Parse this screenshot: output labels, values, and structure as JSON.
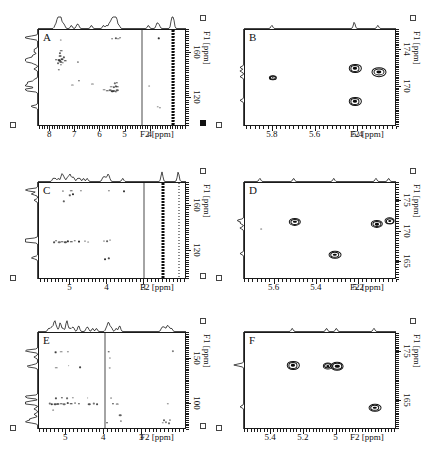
{
  "figure": {
    "type": "multi-panel-2d-nmr-spectra",
    "panel_count": 6,
    "background": "#ffffff",
    "ink": "#111111"
  },
  "axis_titles": {
    "x": "F2 [ppm]",
    "y": "F1 [ppm]"
  },
  "chart_data": [
    {
      "id": "A",
      "type": "scatter",
      "title": "A",
      "xlabel": "F2 [ppm]",
      "ylabel": "F1 [ppm]",
      "xlim": [
        8.45,
        2.55
      ],
      "ylim": [
        180,
        95
      ],
      "xticks": [
        8,
        7,
        6,
        5,
        4
      ],
      "yticks": [
        120,
        160
      ],
      "grid": false,
      "legend": "none",
      "annotations": [
        "solvent t1-noise ridge near 3.1 ppm",
        "vertical artifact line near 4.35 ppm"
      ],
      "ridges": [
        3.12,
        3.05
      ],
      "vlines": [
        4.35
      ],
      "points": [
        {
          "x": 7.62,
          "y": 153.0,
          "r": 2.4
        },
        {
          "x": 7.58,
          "y": 152.2,
          "r": 2.0
        },
        {
          "x": 7.66,
          "y": 153.6,
          "r": 1.8
        },
        {
          "x": 7.55,
          "y": 154.6,
          "r": 1.6
        },
        {
          "x": 7.5,
          "y": 151.4,
          "r": 1.5
        },
        {
          "x": 7.7,
          "y": 151.0,
          "r": 1.4
        },
        {
          "x": 7.46,
          "y": 156.0,
          "r": 1.4
        },
        {
          "x": 7.62,
          "y": 157.2,
          "r": 1.6
        },
        {
          "x": 7.58,
          "y": 149.6,
          "r": 1.5
        },
        {
          "x": 7.4,
          "y": 153.2,
          "r": 1.3
        },
        {
          "x": 7.76,
          "y": 154.0,
          "r": 1.3
        },
        {
          "x": 7.62,
          "y": 160.0,
          "r": 1.5
        },
        {
          "x": 7.56,
          "y": 162.0,
          "r": 1.3
        },
        {
          "x": 7.12,
          "y": 132.0,
          "r": 1.3
        },
        {
          "x": 6.84,
          "y": 135.6,
          "r": 1.2
        },
        {
          "x": 5.84,
          "y": 127.4,
          "r": 1.5
        },
        {
          "x": 5.72,
          "y": 126.6,
          "r": 1.4
        },
        {
          "x": 5.62,
          "y": 127.0,
          "r": 1.5
        },
        {
          "x": 5.52,
          "y": 126.2,
          "r": 1.6
        },
        {
          "x": 5.45,
          "y": 126.8,
          "r": 1.8
        },
        {
          "x": 5.38,
          "y": 126.0,
          "r": 1.7
        },
        {
          "x": 5.33,
          "y": 127.2,
          "r": 1.6
        },
        {
          "x": 5.58,
          "y": 130.4,
          "r": 1.4
        },
        {
          "x": 5.48,
          "y": 130.0,
          "r": 1.5
        },
        {
          "x": 5.4,
          "y": 130.8,
          "r": 1.5
        },
        {
          "x": 5.33,
          "y": 130.2,
          "r": 1.4
        },
        {
          "x": 5.44,
          "y": 133.2,
          "r": 1.3
        },
        {
          "x": 5.36,
          "y": 133.8,
          "r": 1.3
        },
        {
          "x": 6.32,
          "y": 133.0,
          "r": 1.2
        },
        {
          "x": 4.05,
          "y": 131.2,
          "r": 1.2
        },
        {
          "x": 3.72,
          "y": 112.4,
          "r": 1.5
        },
        {
          "x": 3.62,
          "y": 112.0,
          "r": 1.5
        },
        {
          "x": 5.3,
          "y": 172.4,
          "r": 1.5
        },
        {
          "x": 5.4,
          "y": 173.0,
          "r": 1.4
        },
        {
          "x": 5.22,
          "y": 173.2,
          "r": 1.3
        },
        {
          "x": 5.52,
          "y": 172.0,
          "r": 1.2
        },
        {
          "x": 3.68,
          "y": 172.8,
          "r": 1.3
        },
        {
          "x": 7.58,
          "y": 171.6,
          "r": 1.3
        },
        {
          "x": 7.66,
          "y": 145.0,
          "r": 1.2
        },
        {
          "x": 6.9,
          "y": 151.8,
          "r": 1.2
        }
      ]
    },
    {
      "id": "B",
      "type": "scatter",
      "title": "B",
      "xlabel": "F2 [ppm]",
      "ylabel": "F1 [ppm]",
      "xlim": [
        5.93,
        5.22
      ],
      "ylim": [
        176.2,
        165.6
      ],
      "xticks": [
        5.8,
        5.6,
        5.4
      ],
      "yticks": [
        170,
        174
      ],
      "grid": false,
      "legend": "none",
      "points": [
        {
          "x": 5.415,
          "y": 168.4,
          "r": 4.0,
          "style": "contour"
        },
        {
          "x": 5.415,
          "y": 172.0,
          "r": 4.0,
          "style": "contour"
        },
        {
          "x": 5.305,
          "y": 171.6,
          "r": 5.0,
          "style": "contour"
        },
        {
          "x": 5.8,
          "y": 171.0,
          "r": 2.4,
          "style": "contour"
        }
      ]
    },
    {
      "id": "C",
      "type": "scatter",
      "title": "C",
      "xlabel": "F2 [ppm]",
      "ylabel": "F1 [ppm]",
      "xlim": [
        5.85,
        1.85
      ],
      "ylim": [
        180,
        95
      ],
      "xticks": [
        5,
        4,
        3
      ],
      "yticks": [
        120,
        160
      ],
      "grid": false,
      "legend": "none",
      "annotations": [
        "intense solvent t1-noise ridge near 2.5 ppm",
        "second ridge near 2.05 ppm"
      ],
      "ridges": [
        2.5,
        2.06
      ],
      "vlines": [
        3.02
      ],
      "points": [
        {
          "x": 5.3,
          "y": 128.0,
          "r": 1.6
        },
        {
          "x": 5.22,
          "y": 128.6,
          "r": 1.7
        },
        {
          "x": 5.14,
          "y": 128.2,
          "r": 1.6
        },
        {
          "x": 5.06,
          "y": 129.0,
          "r": 1.5
        },
        {
          "x": 4.98,
          "y": 128.4,
          "r": 1.5
        },
        {
          "x": 5.38,
          "y": 129.2,
          "r": 1.4
        },
        {
          "x": 5.44,
          "y": 128.0,
          "r": 1.3
        },
        {
          "x": 4.88,
          "y": 129.4,
          "r": 1.3
        },
        {
          "x": 4.78,
          "y": 128.8,
          "r": 1.2
        },
        {
          "x": 4.62,
          "y": 129.2,
          "r": 1.2
        },
        {
          "x": 4.52,
          "y": 128.6,
          "r": 1.2
        },
        {
          "x": 4.1,
          "y": 129.4,
          "r": 1.4
        },
        {
          "x": 4.02,
          "y": 128.8,
          "r": 1.3
        },
        {
          "x": 3.92,
          "y": 130.0,
          "r": 1.3
        },
        {
          "x": 4.06,
          "y": 113.2,
          "r": 1.3
        },
        {
          "x": 3.96,
          "y": 114.0,
          "r": 1.2
        },
        {
          "x": 5.02,
          "y": 169.2,
          "r": 1.4
        },
        {
          "x": 4.92,
          "y": 170.0,
          "r": 1.3
        },
        {
          "x": 5.2,
          "y": 172.8,
          "r": 1.4
        },
        {
          "x": 4.98,
          "y": 173.4,
          "r": 1.4
        },
        {
          "x": 4.72,
          "y": 173.0,
          "r": 1.3
        },
        {
          "x": 3.96,
          "y": 173.2,
          "r": 1.4
        },
        {
          "x": 3.56,
          "y": 172.6,
          "r": 1.2
        },
        {
          "x": 5.18,
          "y": 164.0,
          "r": 1.2
        }
      ]
    },
    {
      "id": "D",
      "type": "scatter",
      "title": "D",
      "xlabel": "F2 [ppm]",
      "ylabel": "F1 [ppm]",
      "xlim": [
        5.74,
        5.02
      ],
      "ylim": [
        178.0,
        162.0
      ],
      "xticks": [
        5.6,
        5.4,
        5.2
      ],
      "yticks": [
        165,
        170,
        175
      ],
      "grid": false,
      "legend": "none",
      "points": [
        {
          "x": 5.315,
          "y": 166.2,
          "r": 4.2,
          "style": "contour"
        },
        {
          "x": 5.505,
          "y": 171.6,
          "r": 4.0,
          "style": "contour"
        },
        {
          "x": 5.115,
          "y": 171.2,
          "r": 4.0,
          "style": "contour"
        },
        {
          "x": 5.055,
          "y": 171.7,
          "r": 3.4,
          "style": "contour"
        },
        {
          "x": 5.665,
          "y": 170.4,
          "r": 1.2,
          "style": "weak"
        }
      ]
    },
    {
      "id": "E",
      "type": "scatter",
      "title": "E",
      "xlabel": "F2 [ppm]",
      "ylabel": "F1 [ppm]",
      "xlim": [
        5.72,
        1.82
      ],
      "ylim": [
        178,
        72
      ],
      "xticks": [
        5,
        4,
        3
      ],
      "yticks": [
        100,
        150
      ],
      "grid": false,
      "legend": "none",
      "vlines": [
        3.98
      ],
      "points": [
        {
          "x": 5.3,
          "y": 100.6,
          "r": 1.8
        },
        {
          "x": 5.22,
          "y": 100.0,
          "r": 1.9
        },
        {
          "x": 5.14,
          "y": 100.8,
          "r": 1.8
        },
        {
          "x": 5.06,
          "y": 100.2,
          "r": 1.7
        },
        {
          "x": 4.96,
          "y": 101.0,
          "r": 1.6
        },
        {
          "x": 4.88,
          "y": 100.4,
          "r": 1.5
        },
        {
          "x": 5.38,
          "y": 100.2,
          "r": 1.5
        },
        {
          "x": 5.44,
          "y": 101.0,
          "r": 1.4
        },
        {
          "x": 4.78,
          "y": 101.2,
          "r": 1.4
        },
        {
          "x": 4.66,
          "y": 100.6,
          "r": 1.3
        },
        {
          "x": 5.28,
          "y": 106.6,
          "r": 1.4
        },
        {
          "x": 5.12,
          "y": 107.2,
          "r": 1.4
        },
        {
          "x": 4.98,
          "y": 106.8,
          "r": 1.3
        },
        {
          "x": 4.82,
          "y": 107.4,
          "r": 1.3
        },
        {
          "x": 5.34,
          "y": 94.0,
          "r": 1.2
        },
        {
          "x": 4.4,
          "y": 100.4,
          "r": 1.4
        },
        {
          "x": 4.28,
          "y": 101.0,
          "r": 1.4
        },
        {
          "x": 4.18,
          "y": 100.2,
          "r": 1.3
        },
        {
          "x": 4.44,
          "y": 107.0,
          "r": 1.2
        },
        {
          "x": 3.78,
          "y": 100.8,
          "r": 1.5
        },
        {
          "x": 3.66,
          "y": 100.2,
          "r": 1.3
        },
        {
          "x": 3.82,
          "y": 107.2,
          "r": 1.3
        },
        {
          "x": 3.58,
          "y": 88.0,
          "r": 1.4
        },
        {
          "x": 3.56,
          "y": 81.6,
          "r": 1.4
        },
        {
          "x": 3.92,
          "y": 80.0,
          "r": 1.3
        },
        {
          "x": 2.46,
          "y": 79.6,
          "r": 1.4
        },
        {
          "x": 2.38,
          "y": 80.4,
          "r": 1.4
        },
        {
          "x": 2.3,
          "y": 79.2,
          "r": 1.3
        },
        {
          "x": 2.42,
          "y": 83.0,
          "r": 1.3
        },
        {
          "x": 2.26,
          "y": 83.4,
          "r": 1.2
        },
        {
          "x": 2.32,
          "y": 100.6,
          "r": 1.3
        },
        {
          "x": 5.26,
          "y": 140.0,
          "r": 1.3
        },
        {
          "x": 4.94,
          "y": 142.0,
          "r": 1.2
        },
        {
          "x": 4.64,
          "y": 140.6,
          "r": 1.2
        },
        {
          "x": 3.86,
          "y": 140.2,
          "r": 1.3
        },
        {
          "x": 5.28,
          "y": 157.0,
          "r": 1.5
        },
        {
          "x": 5.14,
          "y": 157.6,
          "r": 1.5
        },
        {
          "x": 4.96,
          "y": 157.2,
          "r": 1.4
        },
        {
          "x": 3.88,
          "y": 157.4,
          "r": 1.5
        },
        {
          "x": 2.2,
          "y": 157.8,
          "r": 1.6
        },
        {
          "x": 3.86,
          "y": 150.6,
          "r": 1.2
        }
      ]
    },
    {
      "id": "F",
      "type": "scatter",
      "title": "F",
      "xlabel": "F2 [ppm]",
      "ylabel": "F1 [ppm]",
      "xlim": [
        5.56,
        4.63
      ],
      "ylim": [
        179.0,
        159.0
      ],
      "xticks": [
        5.4,
        5.2,
        5.0
      ],
      "yticks": [
        165,
        175
      ],
      "grid": false,
      "legend": "none",
      "points": [
        {
          "x": 4.765,
          "y": 163.6,
          "r": 4.2,
          "style": "contour"
        },
        {
          "x": 5.265,
          "y": 172.3,
          "r": 4.0,
          "style": "contour"
        },
        {
          "x": 5.055,
          "y": 172.2,
          "r": 3.2,
          "style": "contour"
        },
        {
          "x": 4.995,
          "y": 172.1,
          "r": 4.2,
          "style": "contour"
        }
      ]
    }
  ]
}
